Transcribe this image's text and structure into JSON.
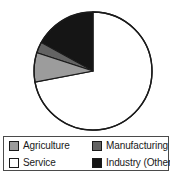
{
  "chart_data": {
    "type": "pie",
    "title": "",
    "categories": [
      "Agriculture",
      "Manufacturing",
      "Service",
      "Industry (Other)"
    ],
    "values": [
      8,
      3,
      72,
      17
    ],
    "unit": "percent",
    "start_angle_deg": 90,
    "direction": "clockwise",
    "legend_position": "bottom",
    "grid": false,
    "slice_colors": [
      "#9c9c9c",
      "#636363",
      "#ffffff",
      "#151515"
    ],
    "slices": [
      {
        "label": "Agriculture",
        "value": 8,
        "color": "#9c9c9c",
        "swatch": "agriculture-swatch"
      },
      {
        "label": "Manufacturing",
        "value": 3,
        "color": "#636363",
        "swatch": "manufacturing-swatch"
      },
      {
        "label": "Service",
        "value": 72,
        "color": "#ffffff",
        "swatch": "service-swatch"
      },
      {
        "label": "Industry (Other)",
        "value": 17,
        "color": "#151515",
        "swatch": "industry-other-swatch"
      }
    ]
  },
  "pie": {
    "center_x": 93,
    "center_y": 71,
    "radius": 59,
    "outline_color": "#1a1a1a"
  },
  "legend": {
    "border_color": "#4a4a4a",
    "entries": [
      {
        "label": "Agriculture",
        "color": "#9c9c9c"
      },
      {
        "label": "Manufacturing",
        "color": "#636363"
      },
      {
        "label": "Service",
        "color": "#ffffff"
      },
      {
        "label": "Industry (Other)",
        "color": "#151515"
      }
    ]
  }
}
